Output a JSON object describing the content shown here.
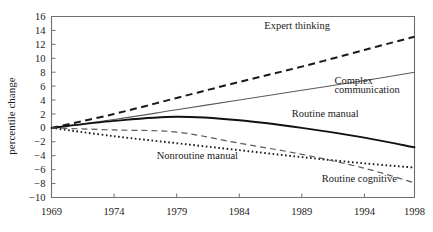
{
  "chart_data": {
    "type": "line",
    "title": "",
    "xlabel": "",
    "ylabel": "percentile change",
    "x": [
      1969,
      1974,
      1979,
      1984,
      1989,
      1994,
      1998
    ],
    "xlim": [
      1969,
      1998
    ],
    "ylim": [
      -10,
      16
    ],
    "yticks": [
      -10,
      -8,
      -6,
      -4,
      -2,
      0,
      2,
      4,
      6,
      8,
      10,
      12,
      14,
      16
    ],
    "ytick_labels": [
      "−10",
      "−8",
      "−6",
      "−4",
      "−2",
      "0",
      "2",
      "4",
      "6",
      "8",
      "10",
      "12",
      "14",
      "16"
    ],
    "xtick_labels": [
      "1969",
      "1974",
      "1979",
      "1984",
      "1989",
      "1994",
      "1998"
    ],
    "grid": false,
    "legend": "inline-annotations",
    "series": [
      {
        "name": "Expert thinking",
        "style": "dashed",
        "color": "#1a1a1a",
        "values": [
          0.0,
          2.0,
          4.3,
          6.6,
          8.8,
          11.2,
          13.1
        ],
        "label_x": 1986.0,
        "label_y": 14.2
      },
      {
        "name": "Complex communication",
        "style": "solid-thin",
        "color": "#5a5a5a",
        "values": [
          0.0,
          1.2,
          2.6,
          4.0,
          5.4,
          6.8,
          8.0
        ],
        "label_x": 1991.6,
        "label_y": 6.3,
        "label_line2_y": 5.0
      },
      {
        "name": "Routine manual",
        "style": "solid-thick",
        "color": "#111111",
        "values": [
          0.0,
          1.0,
          1.6,
          1.1,
          0.0,
          -1.4,
          -2.8
        ],
        "label_x": 1988.2,
        "label_y": 1.5
      },
      {
        "name": "Nonroutine manual",
        "style": "dotted",
        "color": "#1a1a1a",
        "values": [
          0.0,
          -1.2,
          -2.2,
          -3.2,
          -4.2,
          -5.1,
          -5.7
        ],
        "label_x": 1977.4,
        "label_y": -4.5
      },
      {
        "name": "Routine cognitive",
        "style": "dashed-thin",
        "color": "#5a5a5a",
        "values": [
          0.0,
          -0.3,
          -0.6,
          -2.2,
          -3.8,
          -5.8,
          -7.9
        ],
        "label_x": 1990.6,
        "label_y": -7.8
      }
    ],
    "annotations": [
      {
        "text": "Expert thinking"
      },
      {
        "text": "Complex"
      },
      {
        "text": "communication"
      },
      {
        "text": "Routine manual"
      },
      {
        "text": "Nonroutine manual"
      },
      {
        "text": "Routine cognitive"
      }
    ]
  }
}
